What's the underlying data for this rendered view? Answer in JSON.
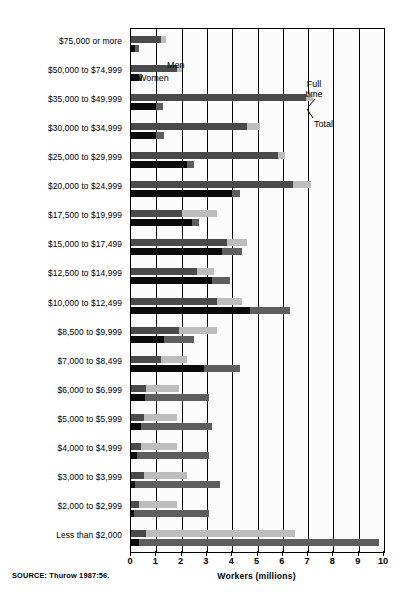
{
  "figure": {
    "source_note": "SOURCE: Thurow 1987:56.",
    "y_axis_title": "Annual income (dollars)",
    "x_axis_title": "Workers (millions)",
    "legend_men": "Men",
    "legend_women": "Women",
    "annotation_full_time": "Full\ntime",
    "annotation_full_time_line1": "Full",
    "annotation_full_time_line2": "time",
    "annotation_total": "Total",
    "colors": {
      "men_full_time": "#4a4a4a",
      "men_total": "#bdbdbd",
      "women_full_time": "#0a0a0a",
      "women_total": "#5e5e5e",
      "axis": "#000000",
      "plot_background": "#fbfbfb"
    }
  },
  "chart_data": {
    "type": "bar",
    "orientation": "horizontal",
    "title": "",
    "xlabel": "Workers (millions)",
    "ylabel": "Annual income (dollars)",
    "xlim": [
      0,
      10
    ],
    "xticks": [
      0,
      1,
      2,
      3,
      4,
      5,
      6,
      7,
      8,
      9,
      10
    ],
    "xticklabels": [
      "0",
      "1",
      "2",
      "3",
      "4",
      "5",
      "6",
      "7",
      "8",
      "9",
      "10"
    ],
    "grid": "vertical",
    "legend": [
      "Men",
      "Women"
    ],
    "legend_position": "inside-top-left",
    "annotations": [
      "Full time",
      "Total"
    ],
    "series_note": "Each income bracket has two grouped bars (Men, Women). The darker inner segment is the Full time count; the lighter outer segment extends to the Total count.",
    "categories": [
      "$75,000 or more",
      "$50,000 to $74,999",
      "$35,000 to $49,999",
      "$30,000 to $34,999",
      "$25,000 to $29,999",
      "$20,000 to $24,999",
      "$17,500 to $19,999",
      "$15,000 to $17,499",
      "$12,500 to $14,999",
      "$10,000 to $12,499",
      "$8,500 to $9,999",
      "$7,000 to $8,499",
      "$6,000 to $6,999",
      "$5,000 to $5,999",
      "$4,000 to $4,999",
      "$3,000 to $3,999",
      "$2,000 to $2,999",
      "Less than $2,000"
    ],
    "series": [
      {
        "name": "Men",
        "segment_full_time": [
          1.2,
          1.8,
          6.9,
          4.6,
          5.8,
          6.4,
          2.0,
          3.8,
          2.6,
          3.4,
          1.9,
          1.2,
          0.6,
          0.5,
          0.4,
          0.5,
          0.3,
          0.6
        ],
        "segment_total": [
          1.4,
          2.0,
          7.2,
          5.1,
          6.1,
          7.1,
          3.4,
          4.6,
          3.3,
          4.4,
          3.4,
          2.2,
          1.9,
          1.8,
          1.8,
          2.2,
          1.8,
          6.5
        ]
      },
      {
        "name": "Women",
        "segment_full_time": [
          0.15,
          0.3,
          1.0,
          1.0,
          2.2,
          4.0,
          2.4,
          3.6,
          3.2,
          4.7,
          1.3,
          2.9,
          0.55,
          0.4,
          0.25,
          0.15,
          0.1,
          0.3
        ],
        "segment_total": [
          0.3,
          0.45,
          1.25,
          1.3,
          2.5,
          4.3,
          2.7,
          4.4,
          3.9,
          6.3,
          2.5,
          4.3,
          3.1,
          3.2,
          3.1,
          3.5,
          3.1,
          9.8
        ]
      }
    ]
  }
}
